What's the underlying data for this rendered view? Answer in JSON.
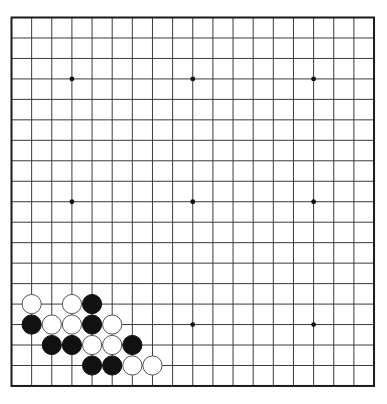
{
  "board": {
    "size": 19,
    "origin_x": 11.5,
    "origin_y": 17.5,
    "spacing_x": 20.14,
    "spacing_y": 20.47,
    "line_color": "#3a3a3a",
    "border_color": "#1a1a1a",
    "background": "#ffffff",
    "star_points": [
      [
        3,
        3
      ],
      [
        9,
        3
      ],
      [
        15,
        3
      ],
      [
        3,
        9
      ],
      [
        9,
        9
      ],
      [
        15,
        9
      ],
      [
        3,
        15
      ],
      [
        9,
        15
      ],
      [
        15,
        15
      ]
    ],
    "stone_radius": 9.6
  },
  "stones": [
    {
      "col": 1,
      "row": 14,
      "color": "white"
    },
    {
      "col": 3,
      "row": 14,
      "color": "white"
    },
    {
      "col": 4,
      "row": 14,
      "color": "black"
    },
    {
      "col": 1,
      "row": 15,
      "color": "black"
    },
    {
      "col": 2,
      "row": 15,
      "color": "white"
    },
    {
      "col": 3,
      "row": 15,
      "color": "white"
    },
    {
      "col": 4,
      "row": 15,
      "color": "black"
    },
    {
      "col": 5,
      "row": 15,
      "color": "white"
    },
    {
      "col": 2,
      "row": 16,
      "color": "black"
    },
    {
      "col": 3,
      "row": 16,
      "color": "black"
    },
    {
      "col": 4,
      "row": 16,
      "color": "white"
    },
    {
      "col": 5,
      "row": 16,
      "color": "white"
    },
    {
      "col": 6,
      "row": 16,
      "color": "black"
    },
    {
      "col": 4,
      "row": 17,
      "color": "black"
    },
    {
      "col": 5,
      "row": 17,
      "color": "black"
    },
    {
      "col": 6,
      "row": 17,
      "color": "white"
    },
    {
      "col": 7,
      "row": 17,
      "color": "white"
    }
  ]
}
